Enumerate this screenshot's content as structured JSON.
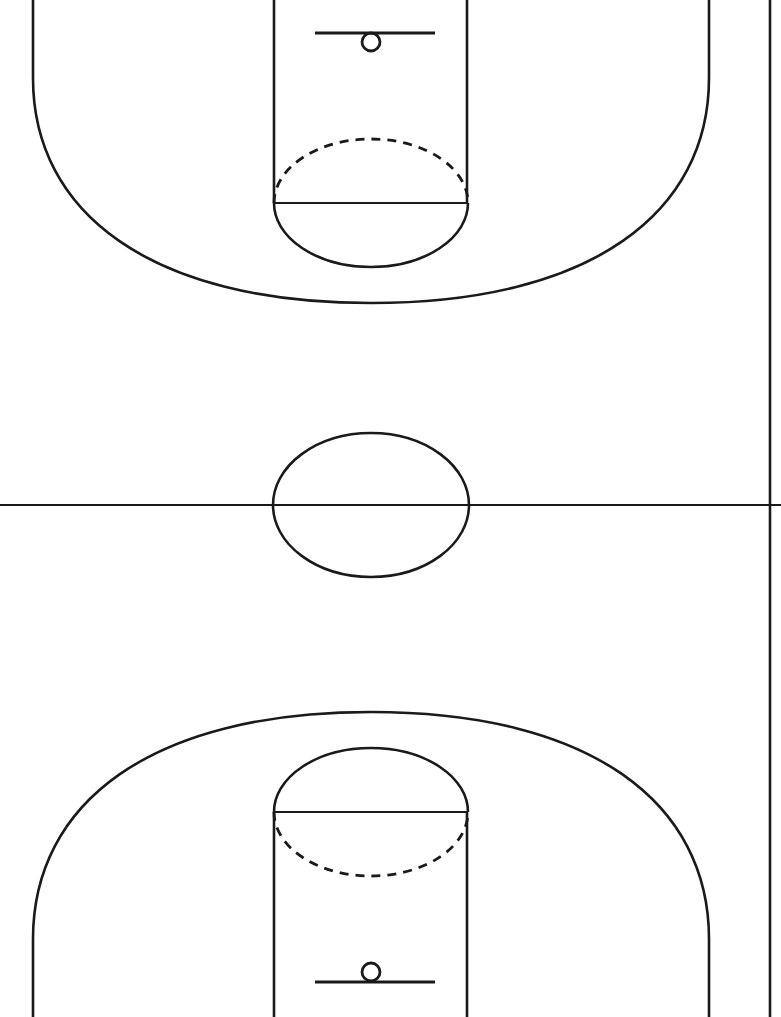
{
  "diagram": {
    "view": "full-court-vertical",
    "orientation": "vertical",
    "background_color": "#ffffff",
    "line_color": "#1a1a1a",
    "line_width_major": 2.6,
    "line_width_minor": 2.2,
    "width_px": 781,
    "height_px": 1017
  },
  "court": {
    "sidelines": {
      "right_sideline_x": 770,
      "right_sideline_visible": true,
      "left_sideline_visible": false,
      "baseline_top_visible": false,
      "baseline_bottom_visible": false,
      "cropped": true
    },
    "half_court_line": {
      "label": "half-court-line",
      "y": 505,
      "x_start": 0,
      "x_end": 781
    },
    "center_circle": {
      "label": "center-circle",
      "cx": 371,
      "cy": 505,
      "rx": 98,
      "ry": 72,
      "style": "solid"
    }
  },
  "top_half": {
    "label": "top-half-court",
    "key": {
      "label": "key-paint-area",
      "left_x": 274,
      "right_x": 467,
      "width": 193,
      "baseline_y": 0,
      "free_throw_line_y": 203
    },
    "free_throw_line": {
      "label": "free-throw-line",
      "y": 203,
      "x_start": 274,
      "x_end": 467
    },
    "free_throw_circle": {
      "label": "free-throw-circle",
      "cx": 371,
      "cy": 203,
      "rx": 97,
      "ry": 64,
      "inside_key_half": "dashed",
      "outside_key_half": "solid"
    },
    "backboard": {
      "label": "backboard",
      "y": 33,
      "x_start": 315,
      "x_end": 435,
      "width": 120
    },
    "hoop": {
      "label": "hoop-rim",
      "cx": 371,
      "cy": 42,
      "r": 9
    },
    "three_point_line": {
      "label": "three-point-line",
      "left_corner_x": 33,
      "right_corner_x": 709,
      "corner_straight_end_y": 78,
      "arc_apex_y": 303,
      "arc_center_x": 371
    }
  },
  "bottom_half": {
    "label": "bottom-half-court",
    "key": {
      "label": "key-paint-area",
      "left_x": 274,
      "right_x": 467,
      "width": 193,
      "baseline_y": 1017,
      "free_throw_line_y": 812
    },
    "free_throw_line": {
      "label": "free-throw-line",
      "y": 812,
      "x_start": 274,
      "x_end": 467
    },
    "free_throw_circle": {
      "label": "free-throw-circle",
      "cx": 371,
      "cy": 812,
      "rx": 97,
      "ry": 64,
      "inside_key_half": "dashed",
      "outside_key_half": "solid"
    },
    "backboard": {
      "label": "backboard",
      "y": 982,
      "x_start": 315,
      "x_end": 435,
      "width": 120
    },
    "hoop": {
      "label": "hoop-rim",
      "cx": 371,
      "cy": 972,
      "r": 9
    },
    "three_point_line": {
      "label": "three-point-line",
      "left_corner_x": 33,
      "right_corner_x": 709,
      "corner_straight_end_y": 939,
      "arc_apex_y": 712,
      "arc_center_x": 371
    }
  },
  "style_tokens": {
    "dash_pattern": "9 7",
    "stroke_color": "#1a1a1a",
    "fill_color": "none"
  }
}
